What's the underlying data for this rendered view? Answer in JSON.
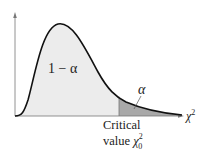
{
  "diagram": {
    "type": "chi-square distribution with right-tail critical region",
    "region_labels": {
      "left_area": "1 − α",
      "right_tail": "α"
    },
    "axis": {
      "x_label_base": "χ",
      "x_label_sup": "2"
    },
    "critical": {
      "line1": "Critical",
      "line2_prefix": "value ",
      "symbol": "χ",
      "sup": "2",
      "sub": "0"
    },
    "colors": {
      "curve": "#111111",
      "axis": "#777777",
      "body_fill": "#ececec",
      "tail_fill": "#a9a9a9",
      "text": "#222222"
    }
  }
}
